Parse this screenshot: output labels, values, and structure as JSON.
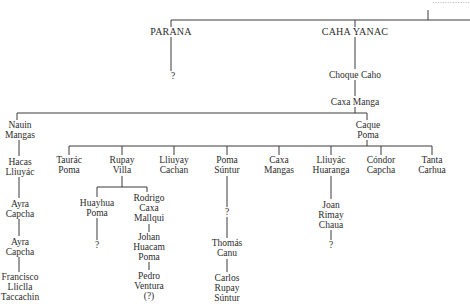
{
  "diagram": {
    "type": "genealogy-tree",
    "top_cut_label": "...............",
    "nodes": {
      "parana": [
        "PARANA"
      ],
      "parana_child": [
        "?"
      ],
      "caha_yanac": [
        "CAHA YANAC"
      ],
      "choque_caho": [
        "Choque Caho"
      ],
      "caxa_manga": [
        "Caxa Manga"
      ],
      "nauin_mangas": [
        "Nauin",
        "Mangas"
      ],
      "hacas_lliuyac": [
        "Hacas",
        "Lliuyác"
      ],
      "ayra_capcha_1": [
        "Ayra",
        "Capcha"
      ],
      "ayra_capcha_2": [
        "Ayra",
        "Capcha"
      ],
      "francisco": [
        "Francisco",
        "Lliclla",
        "Taccachin"
      ],
      "caque_poma": [
        "Caque",
        "Poma"
      ],
      "taurac_poma": [
        "Taurác",
        "Poma"
      ],
      "rupay_villa": [
        "Rupay",
        "Villa"
      ],
      "huayhua_poma": [
        "Huayhua",
        "Poma"
      ],
      "huayhua_child": [
        "?"
      ],
      "rodrigo": [
        "Rodrigo",
        "Caxa",
        "Mallqui"
      ],
      "johan": [
        "Johan",
        "Huacam",
        "Poma"
      ],
      "pedro": [
        "Pedro",
        "Ventura",
        "(?)"
      ],
      "lliuyay_cachan": [
        "Lliuyay",
        "Cachan"
      ],
      "poma_suntur": [
        "Poma",
        "Súntur"
      ],
      "poma_suntur_child": [
        "?"
      ],
      "thomas_canu": [
        "Thomás",
        "Canu"
      ],
      "carlos": [
        "Carlos",
        "Rupay",
        "Súntur"
      ],
      "caxa_mangas": [
        "Caxa",
        "Mangas"
      ],
      "lliuyac_huaranga": [
        "Lliuyác",
        "Huaranga"
      ],
      "joan": [
        "Joan",
        "Rimay",
        "Chaua"
      ],
      "joan_child": [
        "?"
      ],
      "condor_capcha": [
        "Cóndor",
        "Capcha"
      ],
      "tanta_carhua": [
        "Tanta",
        "Carhua"
      ]
    },
    "line_color": "#3a3a3a",
    "background": "#ffffff"
  }
}
